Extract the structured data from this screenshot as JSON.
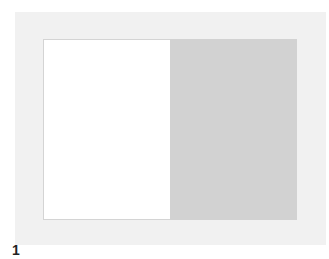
{
  "figure": {
    "label": "1",
    "colors": {
      "frame": "#f1f1f1",
      "left_panel": "#ffffff",
      "right_panel": "#d2d2d2"
    }
  }
}
